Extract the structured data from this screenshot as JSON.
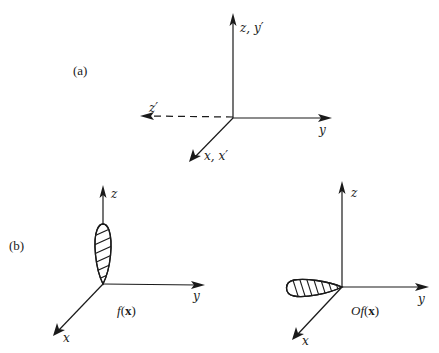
{
  "figure": {
    "panel_a": {
      "label": "(a)",
      "axes": {
        "z_y_prime": "z, y′",
        "y": "y",
        "z_prime": "z′",
        "x_x_prime": "x, x′"
      },
      "z_prime_style": "dashed"
    },
    "panel_b": {
      "label": "(b)",
      "left": {
        "axes": {
          "z": "z",
          "y": "y",
          "x": "x"
        },
        "function_prefix": "f",
        "function_arg_open": "(",
        "function_arg": "x",
        "function_arg_close": ")",
        "lobe_orientation": "along +z"
      },
      "right": {
        "axes": {
          "z": "z",
          "y": "y",
          "x": "x"
        },
        "function_prefix": "Of",
        "function_arg_open": "(",
        "function_arg": "x",
        "function_arg_close": ")",
        "lobe_orientation": "along −y"
      }
    }
  }
}
